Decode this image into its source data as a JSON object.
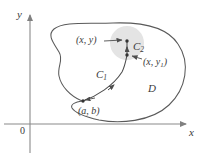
{
  "figure": {
    "caption_domain_label": "D",
    "colors": {
      "curve": "#4d4d4d",
      "region_boundary": "#595959",
      "axis": "#808080",
      "disk_fill": "#e2e2e2",
      "text": "#3a3a3a",
      "background": "#ffffff"
    },
    "axes": {
      "y_label": "y",
      "x_label": "x",
      "origin_label": "0",
      "origin_px": {
        "x": 30,
        "y": 124
      },
      "x_axis_end_px": {
        "x": 187,
        "y": 124
      },
      "y_axis_top_px": {
        "x": 30,
        "y": 14
      }
    },
    "labels": [
      {
        "name": "point-xy-label",
        "text": "(x, y)",
        "x": 76,
        "y": 35
      },
      {
        "name": "point-xy1-label",
        "text": "(x, y",
        "sub": "1",
        "tail": ")",
        "x": 143,
        "y": 57
      },
      {
        "name": "curve-c2-label",
        "text": "C",
        "sub": "2",
        "x": 133,
        "y": 41
      },
      {
        "name": "curve-c1-label",
        "text": "C",
        "sub": "1",
        "x": 96,
        "y": 69
      },
      {
        "name": "point-ab-label",
        "text": "(a, b)",
        "x": 78,
        "y": 106
      },
      {
        "name": "region-d-label",
        "text": "D",
        "x": 148,
        "y": 83
      }
    ],
    "points": [
      {
        "name": "point-xy",
        "x": 127,
        "y": 41
      },
      {
        "name": "point-xy1",
        "x": 127,
        "y": 55
      },
      {
        "name": "point-ab",
        "x": 82,
        "y": 101
      }
    ],
    "disk": {
      "cx": 127,
      "cy": 43,
      "r": 17
    },
    "region_path": "M 82 101 C 70 96 62 86 60 76 C 58 66 64 60 60 53 C 55 44 48 36 54 30 C 62 22 86 25 112 24 C 140 23 166 27 177 43 C 190 62 186 88 170 104 C 152 121 120 123 100 120 C 86 118 76 113 73 108 C 71 104 76 103 82 101 Z",
    "curve_c1_path": "M 82 101 C 96 96 112 86 122 72 C 125 66 126 60 127 55",
    "curve_c2_path": "M 127 55 L 127 41",
    "arrow_xy_path": "M 103 41 L 123 41",
    "arrow_xy1_path": "M 141 59 L 131 56",
    "arrow_ab_path": "M 95 100 L 85 101"
  }
}
